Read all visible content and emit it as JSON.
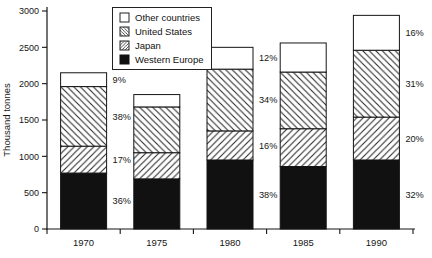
{
  "chart_data": {
    "type": "bar",
    "stacked": true,
    "title": "",
    "ylabel": "Thousand tonnes",
    "xlabel": "",
    "ylim": [
      0,
      3000
    ],
    "yticks": [
      0,
      500,
      1000,
      1500,
      2000,
      2500,
      3000
    ],
    "grid": false,
    "categories": [
      "1970",
      "1975",
      "1980",
      "1985",
      "1990"
    ],
    "series": [
      {
        "name": "Western Europe",
        "pattern": "solid-black",
        "values": [
          770,
          690,
          950,
          860,
          950
        ],
        "pct_labels": [
          "36%",
          null,
          "38%",
          null,
          "32%"
        ]
      },
      {
        "name": "Japan",
        "pattern": "hatch-forward",
        "values": [
          370,
          360,
          400,
          520,
          590
        ],
        "pct_labels": [
          "17%",
          null,
          "16%",
          null,
          "20%"
        ]
      },
      {
        "name": "United States",
        "pattern": "hatch-backward",
        "values": [
          820,
          630,
          850,
          780,
          920
        ],
        "pct_labels": [
          "38%",
          null,
          "34%",
          null,
          "31%"
        ]
      },
      {
        "name": "Other countries",
        "pattern": "white",
        "values": [
          190,
          170,
          300,
          400,
          480
        ],
        "pct_labels": [
          "9%",
          null,
          "12%",
          null,
          "16%"
        ]
      }
    ],
    "legend": {
      "position": "top-center",
      "entries": [
        "Other countries",
        "United States",
        "Japan",
        "Western Europe"
      ]
    },
    "colors": {
      "ink": "#151515",
      "background": "#ffffff"
    }
  }
}
